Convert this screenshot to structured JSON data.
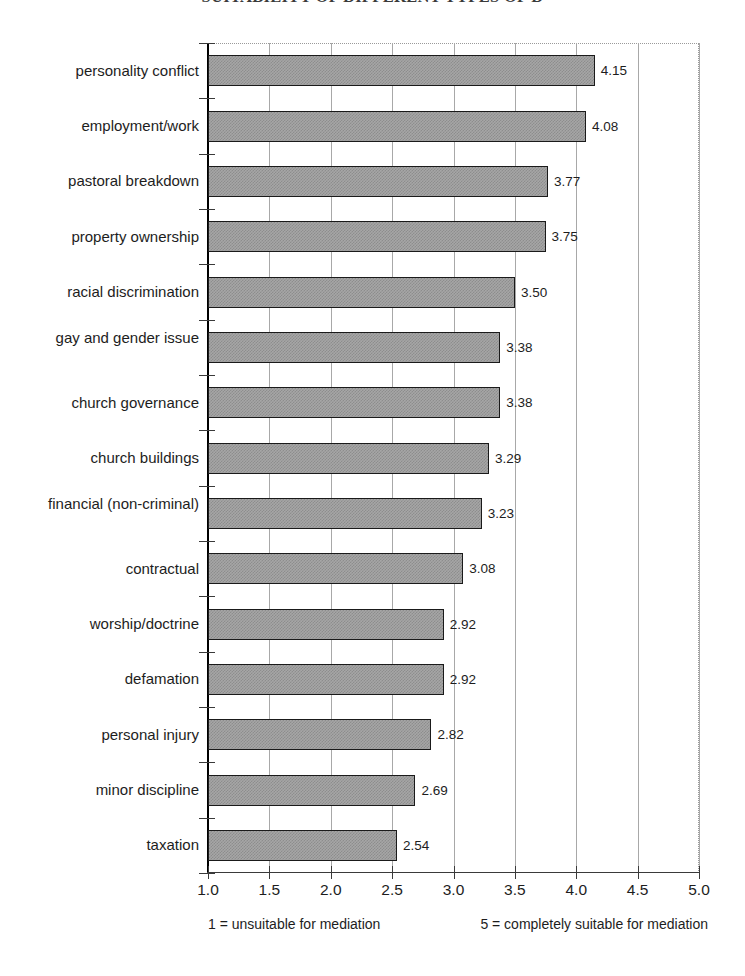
{
  "chart_data": {
    "type": "bar",
    "orientation": "horizontal",
    "title": "SUITABILITY OF DIFFERENT TYPES OF D",
    "xlabel": "",
    "ylabel": "",
    "xlim": [
      1.0,
      5.0
    ],
    "grid": true,
    "legend": null,
    "categories": [
      "personality conflict",
      "employment/work",
      "pastoral breakdown",
      "property ownership",
      "racial discrimination",
      "gay and gender issue",
      "church governance",
      "church buildings",
      "financial (non-criminal)",
      "contractual",
      "worship/doctrine",
      "defamation",
      "personal injury",
      "minor discipline",
      "taxation"
    ],
    "values": [
      4.15,
      4.08,
      3.77,
      3.75,
      3.5,
      3.38,
      3.38,
      3.29,
      3.23,
      3.08,
      2.92,
      2.92,
      2.82,
      2.69,
      2.54
    ],
    "value_labels": [
      "4.15",
      "4.08",
      "3.77",
      "3.75",
      "3.50",
      "3.38",
      "3.38",
      "3.29",
      "3.23",
      "3.08",
      "2.92",
      "2.92",
      "2.82",
      "2.69",
      "2.54"
    ],
    "xticks": [
      1.0,
      1.5,
      2.0,
      2.5,
      3.0,
      3.5,
      4.0,
      4.5,
      5.0
    ],
    "xtick_labels": [
      "1.0",
      "1.5",
      "2.0",
      "2.5",
      "3.0",
      "3.5",
      "4.0",
      "4.5",
      "5.0"
    ],
    "notes": {
      "left": "1 = unsuitable for mediation",
      "right": "5 = completely suitable for mediation"
    },
    "colors": {
      "bar_fill": "#a6a6a6",
      "bar_pattern": "#8d8d8d",
      "bar_border": "#1a1a1a",
      "gridline": "#a8a8a8",
      "axis": "#3a3a3a",
      "text": "#1d1d1d",
      "background": "#ffffff"
    }
  }
}
